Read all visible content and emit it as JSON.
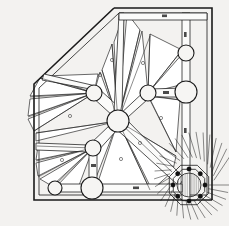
{
  "drawing": {
    "title": "Radial roof framing plan",
    "type": "architectural-plan",
    "background_color": "#f3f2f0",
    "ink_color": "#1a1a1a",
    "hatch_color": "#3a3a3a",
    "panel_fill": "#ffffff",
    "column_color": "#111111",
    "canvas": {
      "width": 229,
      "height": 226
    }
  },
  "boundary": {
    "name": "building-outline",
    "description": "Trapezoidal plan with chamfered upper-left corner, vertical left wall, horizontal bottom wall and horizontal top-right wall meeting a vertical right wall",
    "points": "114,8 34,84 34,200 212,200 212,8",
    "wall_offset": 5
  },
  "hub": {
    "name": "main-hub-node",
    "cx": 118,
    "cy": 121,
    "r": 11,
    "label": "A"
  },
  "nodes": [
    {
      "name": "node-upper-left",
      "cx": 94,
      "cy": 93,
      "r": 8,
      "label": "B"
    },
    {
      "name": "node-lower-left",
      "cx": 93,
      "cy": 148,
      "r": 8,
      "label": "C"
    },
    {
      "name": "node-mid-right",
      "cx": 148,
      "cy": 93,
      "r": 8,
      "label": "D"
    },
    {
      "name": "node-right-major",
      "cx": 186,
      "cy": 92,
      "r": 11,
      "label": "E"
    },
    {
      "name": "node-right-upper",
      "cx": 186,
      "cy": 53,
      "r": 8,
      "label": "F"
    },
    {
      "name": "node-bottom-mid",
      "cx": 92,
      "cy": 188,
      "r": 11,
      "label": "G"
    },
    {
      "name": "node-bottom-left",
      "cx": 55,
      "cy": 188,
      "r": 7,
      "label": "H"
    }
  ],
  "lantern": {
    "name": "octagonal-lantern",
    "cx": 189,
    "cy": 185,
    "outer_radius": 20,
    "ring_radius": 16,
    "inner_radius": 12,
    "sides": 8,
    "column_count": 8,
    "column_radius": 2.1,
    "ray_count": 34,
    "ray_inner": 21,
    "ray_outer": 40,
    "inner_hatch": "vertical"
  },
  "beams": [
    {
      "name": "beam-hub-to-lantern",
      "from": "hub",
      "to": "lantern",
      "label": "1"
    },
    {
      "name": "beam-hub-to-upper-left",
      "from": "hub",
      "to": "node-upper-left",
      "label": "2"
    },
    {
      "name": "beam-hub-to-lower-left",
      "from": "hub",
      "to": "node-lower-left",
      "label": "3"
    },
    {
      "name": "beam-hub-to-mid-right",
      "from": "hub",
      "to": "node-mid-right",
      "label": "4"
    },
    {
      "name": "beam-hub-to-apex",
      "from": "hub",
      "to": "apex",
      "label": "5"
    },
    {
      "name": "beam-mid-to-right",
      "from": "node-mid-right",
      "to": "node-right-major",
      "label": "6"
    },
    {
      "name": "beam-right-vertical",
      "from": "node-right-upper",
      "to": "node-right-major",
      "label": "7"
    },
    {
      "name": "beam-lower-left-down",
      "from": "node-lower-left",
      "to": "node-bottom-mid",
      "label": "8"
    },
    {
      "name": "beam-bottom-run",
      "from": "node-bottom-left",
      "to": "node-bottom-mid",
      "label": "9"
    }
  ],
  "radial_fans": [
    {
      "name": "fan-top-left",
      "origin": "node-upper-left",
      "panels": 4,
      "hatch": "diagonal"
    },
    {
      "name": "fan-left-upper",
      "origin": "hub",
      "panels": 5,
      "hatch": "diagonal"
    },
    {
      "name": "fan-left-lower",
      "origin": "node-lower-left",
      "panels": 5,
      "hatch": "diagonal"
    },
    {
      "name": "fan-top-right",
      "origin": "hub",
      "panels": 5,
      "hatch": "diagonal"
    },
    {
      "name": "fan-lantern",
      "origin": "lantern",
      "panels": 6,
      "hatch": "diagonal"
    }
  ],
  "dimension_labels": [
    {
      "name": "dim-top",
      "text": "▪",
      "x": 164,
      "y": 13
    },
    {
      "name": "dim-right-up",
      "text": "▪",
      "x": 188,
      "y": 33
    },
    {
      "name": "dim-right-mid",
      "text": "▪",
      "x": 190,
      "y": 131
    },
    {
      "name": "dim-mid-right",
      "text": "▪",
      "x": 166,
      "y": 93
    },
    {
      "name": "dim-bottom",
      "text": "▪",
      "x": 136,
      "y": 192
    },
    {
      "name": "dim-left-mid",
      "text": "▪",
      "x": 95,
      "y": 166
    }
  ]
}
